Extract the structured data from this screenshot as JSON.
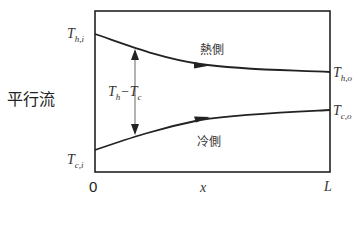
{
  "title": "平行流",
  "labels": {
    "hot_inlet": {
      "T": "T",
      "sub": "h,i"
    },
    "hot_outlet": {
      "T": "T",
      "sub": "h,o"
    },
    "cold_inlet": {
      "T": "T",
      "sub": "c,i"
    },
    "cold_outlet": {
      "T": "T",
      "sub": "c,o"
    },
    "difference": {
      "a": "T",
      "a_sub": "h",
      "minus": "−",
      "b": "T",
      "b_sub": "c"
    },
    "hot_side": "熱側",
    "cold_side": "冷側"
  },
  "axis": {
    "x_origin": "0",
    "x_label": "x",
    "x_end": "L"
  },
  "colors": {
    "line": "#222222",
    "arrow_guide": "#555555"
  }
}
